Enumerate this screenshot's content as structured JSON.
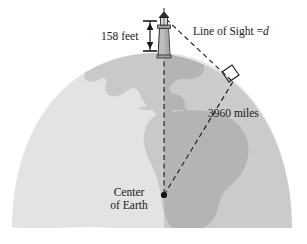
{
  "figure": {
    "type": "geometry-diagram",
    "width": 307,
    "height": 244,
    "background_color": "#ffffff"
  },
  "labels": {
    "height_label": "158 feet",
    "line_of_sight_label": "Line of Sight =",
    "line_of_sight_variable": "d",
    "radius_label": "3960 miles",
    "center_label_line1": "Center",
    "center_label_line2": "of Earth"
  },
  "colors": {
    "ocean": "#e2e2e2",
    "land": "#c9c9c9",
    "shaded_hemisphere": "#b4b4b4",
    "line": "#1a1a1a",
    "text": "#1a1a1a",
    "lighthouse_body": "#b9b9b9",
    "lighthouse_outline": "#2b2b2b"
  },
  "geometry": {
    "earth_center": {
      "x": 164,
      "y": 195
    },
    "lighthouse_top": {
      "x": 165,
      "y": 18
    },
    "lighthouse_base": {
      "x": 164,
      "y": 57
    },
    "tangent_point": {
      "x": 232,
      "y": 82
    },
    "radius_value": 3960,
    "radius_units": "miles",
    "tower_height_value": 158,
    "tower_height_units": "feet",
    "right_angle_at": "tangent-point"
  }
}
